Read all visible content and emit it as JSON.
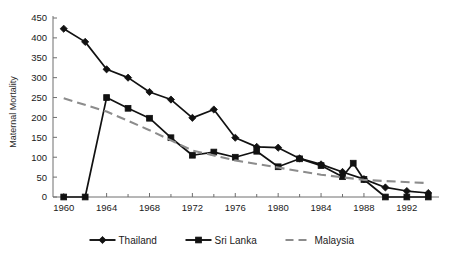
{
  "chart_data": {
    "type": "line",
    "title": "",
    "xlabel": "",
    "ylabel": "Maternal Mortality",
    "xlim": [
      1959,
      1995
    ],
    "ylim": [
      0,
      450
    ],
    "ytick_step": 50,
    "xtick_step": 4,
    "xtick_minor_step": 2,
    "grid": false,
    "legend_position": "bottom-center",
    "yticks": [
      0,
      50,
      100,
      150,
      200,
      250,
      300,
      350,
      400,
      450
    ],
    "ytick_labels": [
      "0",
      "50",
      "100",
      "150",
      "200",
      "250",
      "300",
      "350",
      "400",
      "450"
    ],
    "xticks": [
      1960,
      1964,
      1968,
      1972,
      1976,
      1980,
      1984,
      1988,
      1992
    ],
    "xtick_labels": [
      "1960",
      "1964",
      "1968",
      "1972",
      "1976",
      "1980",
      "1984",
      "1988",
      "1992"
    ],
    "series": [
      {
        "name": "Thailand",
        "color": "#111111",
        "style": "solid",
        "marker": "diamond",
        "x": [
          1960,
          1962,
          1964,
          1966,
          1968,
          1970,
          1972,
          1974,
          1976,
          1978,
          1980,
          1982,
          1984,
          1986,
          1988,
          1990,
          1992,
          1994
        ],
        "values": [
          423,
          390,
          321,
          300,
          264,
          245,
          199,
          220,
          149,
          126,
          124,
          97,
          82,
          63,
          45,
          24,
          15,
          10
        ]
      },
      {
        "name": "Sri Lanka",
        "color": "#111111",
        "style": "solid",
        "marker": "square",
        "x": [
          1960,
          1962,
          1964,
          1966,
          1968,
          1970,
          1972,
          1974,
          1976,
          1978,
          1980,
          1982,
          1984,
          1986,
          1987,
          1988,
          1990,
          1992,
          1994
        ],
        "values": [
          0,
          0,
          250,
          223,
          198,
          149,
          105,
          113,
          100,
          115,
          76,
          96,
          79,
          51,
          85,
          44,
          0,
          0,
          0
        ]
      },
      {
        "name": "Malaysia",
        "color": "#8c8c8c",
        "style": "dashed",
        "marker": "none",
        "x": [
          1960,
          1964,
          1968,
          1972,
          1976,
          1980,
          1984,
          1988,
          1990,
          1994
        ],
        "values": [
          248,
          215,
          168,
          117,
          92,
          74,
          56,
          43,
          40,
          35
        ]
      }
    ]
  },
  "legend": {
    "items": [
      {
        "label": "Thailand",
        "marker": "diamond",
        "style": "solid",
        "color": "#111111"
      },
      {
        "label": "Sri Lanka",
        "marker": "square",
        "style": "solid",
        "color": "#111111"
      },
      {
        "label": "Malaysia",
        "marker": "none",
        "style": "dashed",
        "color": "#8c8c8c"
      }
    ]
  }
}
